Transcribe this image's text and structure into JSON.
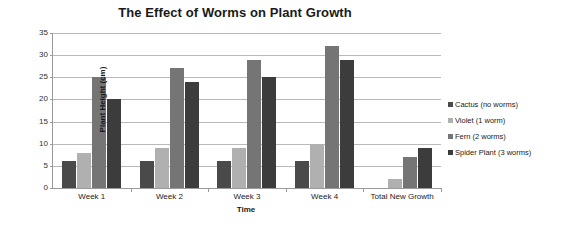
{
  "chart_data": {
    "type": "bar",
    "title": "The Effect of Worms on Plant Growth",
    "xlabel": "Time",
    "ylabel": "Plant Height (cm)",
    "categories": [
      "Week 1",
      "Week 2",
      "Week 3",
      "Week 4",
      "Total New Growth"
    ],
    "ylim": [
      0,
      35
    ],
    "yticks": [
      0,
      5,
      10,
      15,
      20,
      25,
      30,
      35
    ],
    "grid": true,
    "legend_position": "right",
    "series": [
      {
        "name": "Cactus (no worms)",
        "color": "#4a4a4a",
        "values": [
          6,
          6,
          6,
          6,
          0
        ]
      },
      {
        "name": "Violet (1 worm)",
        "color": "#b0b0b0",
        "values": [
          8,
          9,
          9,
          10,
          2
        ]
      },
      {
        "name": "Fern (2 worms)",
        "color": "#757575",
        "values": [
          25,
          27,
          29,
          32,
          7
        ]
      },
      {
        "name": "Spider Plant (3 worms)",
        "color": "#3c3c3c",
        "values": [
          20,
          24,
          25,
          29,
          9
        ]
      }
    ]
  }
}
